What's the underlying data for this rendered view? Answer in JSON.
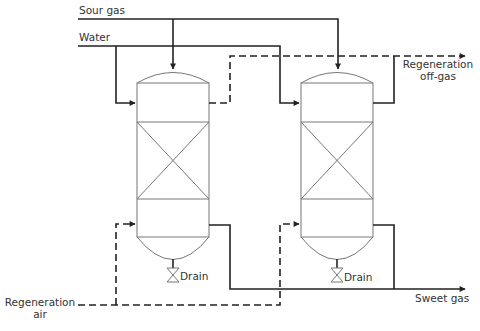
{
  "labels": {
    "sour_gas": "Sour gas",
    "water": "Water",
    "regen_offgas_line1": "Regeneration",
    "regen_offgas_line2": "off-gas",
    "regen_air_line1": "Regeneration",
    "regen_air_line2": "air",
    "drain_left": "Drain",
    "drain_right": "Drain",
    "sweet_gas": "Sweet gas"
  },
  "colors": {
    "process_line": "#222222",
    "vessel_outline": "#777777",
    "text": "#333333"
  }
}
